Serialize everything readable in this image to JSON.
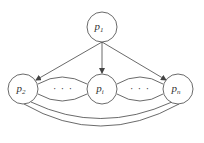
{
  "diagram": {
    "colors": {
      "stroke": "#444444",
      "background": "#ffffff",
      "text": "#333333"
    },
    "nodes": [
      {
        "id": "top",
        "base": "p",
        "sub": "1",
        "cx": 102,
        "cy": 27,
        "r": 15
      },
      {
        "id": "left",
        "base": "p",
        "sub": "2",
        "cx": 23,
        "cy": 89,
        "r": 15
      },
      {
        "id": "middle",
        "base": "p",
        "sub": "i",
        "cx": 102,
        "cy": 89,
        "r": 15
      },
      {
        "id": "right",
        "base": "p",
        "sub": "n",
        "cx": 178,
        "cy": 89,
        "r": 15
      }
    ],
    "edges": [
      {
        "from": "top",
        "to": "left",
        "type": "arrow"
      },
      {
        "from": "top",
        "to": "middle",
        "type": "arrow"
      },
      {
        "from": "top",
        "to": "right",
        "type": "arrow"
      },
      {
        "from": "left",
        "to": "middle",
        "type": "double-arc",
        "label": "· · ·"
      },
      {
        "from": "middle",
        "to": "right",
        "type": "double-arc",
        "label": "· · ·"
      },
      {
        "from": "left",
        "to": "right",
        "type": "double-arc-bottom"
      }
    ],
    "ellipsis_left": "· · ·",
    "ellipsis_right": "· · ·"
  }
}
